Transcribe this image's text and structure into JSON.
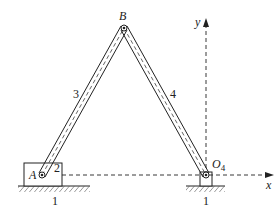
{
  "diagram": {
    "points": {
      "A": {
        "label": "A",
        "x": 42,
        "y": 175
      },
      "B": {
        "label": "B",
        "x": 124,
        "y": 28
      },
      "O4": {
        "label": "O",
        "sub": "4",
        "x": 206,
        "y": 175
      }
    },
    "links": {
      "link3": {
        "label": "3"
      },
      "link4": {
        "label": "4"
      },
      "slider2": {
        "label": "2"
      },
      "ground_left": {
        "label": "1"
      },
      "ground_right": {
        "label": "1"
      }
    },
    "axes": {
      "x_label": "x",
      "y_label": "y"
    },
    "colors": {
      "line": "#222222",
      "hatch": "#555555"
    }
  }
}
